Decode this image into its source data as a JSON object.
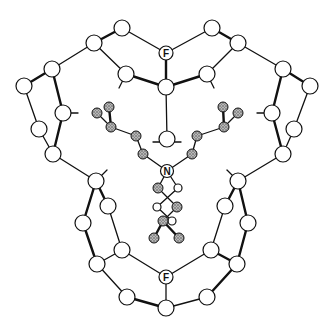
{
  "diagram": {
    "type": "molecular-structure",
    "labels": {
      "fluorine_top": "F",
      "fluorine_bottom": "F",
      "nitrogen": "N"
    },
    "colors": {
      "bond": "#111111",
      "atom_fill": "#ffffff",
      "shaded_atom": "#9a9a9a"
    },
    "cage_atoms": [
      {
        "id": "a1",
        "x": 122,
        "y": 28,
        "r": 8
      },
      {
        "id": "a2",
        "x": 94,
        "y": 43,
        "r": 8
      },
      {
        "id": "a3",
        "x": 52,
        "y": 69,
        "r": 8
      },
      {
        "id": "a4",
        "x": 24,
        "y": 86,
        "r": 8
      },
      {
        "id": "a5",
        "x": 126,
        "y": 74,
        "r": 8
      },
      {
        "id": "Ftop",
        "x": 166,
        "y": 53,
        "r": 6
      },
      {
        "id": "Ctop",
        "x": 166,
        "y": 87,
        "r": 8
      },
      {
        "id": "a6",
        "x": 212,
        "y": 28,
        "r": 8
      },
      {
        "id": "a7",
        "x": 238,
        "y": 43,
        "r": 8
      },
      {
        "id": "a8",
        "x": 283,
        "y": 69,
        "r": 8
      },
      {
        "id": "a9",
        "x": 310,
        "y": 86,
        "r": 8
      },
      {
        "id": "a10",
        "x": 207,
        "y": 74,
        "r": 8
      },
      {
        "id": "a11",
        "x": 63,
        "y": 113,
        "r": 8
      },
      {
        "id": "a12",
        "x": 39,
        "y": 129,
        "r": 8
      },
      {
        "id": "a13",
        "x": 53,
        "y": 154,
        "r": 8
      },
      {
        "id": "a14",
        "x": 272,
        "y": 113,
        "r": 8
      },
      {
        "id": "a15",
        "x": 294,
        "y": 129,
        "r": 8
      },
      {
        "id": "a16",
        "x": 283,
        "y": 154,
        "r": 8
      },
      {
        "id": "a17",
        "x": 167,
        "y": 139,
        "r": 8
      },
      {
        "id": "b1",
        "x": 96,
        "y": 181,
        "r": 8
      },
      {
        "id": "b2",
        "x": 108,
        "y": 206,
        "r": 8
      },
      {
        "id": "b3",
        "x": 83,
        "y": 223,
        "r": 8
      },
      {
        "id": "b4",
        "x": 122,
        "y": 250,
        "r": 8
      },
      {
        "id": "b5",
        "x": 97,
        "y": 264,
        "r": 8
      },
      {
        "id": "Fbot",
        "x": 166,
        "y": 277,
        "r": 6
      },
      {
        "id": "b6",
        "x": 127,
        "y": 297,
        "r": 8
      },
      {
        "id": "Cbot",
        "x": 166,
        "y": 308,
        "r": 8
      },
      {
        "id": "b7",
        "x": 238,
        "y": 181,
        "r": 8
      },
      {
        "id": "b8",
        "x": 225,
        "y": 206,
        "r": 8
      },
      {
        "id": "b9",
        "x": 248,
        "y": 223,
        "r": 8
      },
      {
        "id": "b10",
        "x": 211,
        "y": 250,
        "r": 8
      },
      {
        "id": "b11",
        "x": 237,
        "y": 264,
        "r": 8
      },
      {
        "id": "b12",
        "x": 207,
        "y": 297,
        "r": 8
      }
    ],
    "guest_atoms": [
      {
        "id": "N",
        "x": 167,
        "y": 171,
        "r": 6,
        "shaded": false
      },
      {
        "id": "g1",
        "x": 97,
        "y": 113,
        "r": 5,
        "shaded": true
      },
      {
        "id": "g2",
        "x": 109,
        "y": 107,
        "r": 5,
        "shaded": true
      },
      {
        "id": "g3",
        "x": 111,
        "y": 127,
        "r": 5,
        "shaded": true
      },
      {
        "id": "g4",
        "x": 136,
        "y": 136,
        "r": 5,
        "shaded": true
      },
      {
        "id": "g5",
        "x": 143,
        "y": 154,
        "r": 5,
        "shaded": true
      },
      {
        "id": "g6",
        "x": 223,
        "y": 107,
        "r": 5,
        "shaded": true
      },
      {
        "id": "g7",
        "x": 238,
        "y": 113,
        "r": 5,
        "shaded": true
      },
      {
        "id": "g8",
        "x": 224,
        "y": 127,
        "r": 5,
        "shaded": true
      },
      {
        "id": "g9",
        "x": 197,
        "y": 136,
        "r": 5,
        "shaded": true
      },
      {
        "id": "g10",
        "x": 192,
        "y": 154,
        "r": 5,
        "shaded": true
      },
      {
        "id": "g11",
        "x": 158,
        "y": 188,
        "r": 5,
        "shaded": true
      },
      {
        "id": "g12",
        "x": 178,
        "y": 188,
        "r": 4,
        "shaded": false
      },
      {
        "id": "g13",
        "x": 157,
        "y": 207,
        "r": 4,
        "shaded": false
      },
      {
        "id": "g14",
        "x": 177,
        "y": 207,
        "r": 5,
        "shaded": true
      },
      {
        "id": "g15",
        "x": 163,
        "y": 221,
        "r": 5,
        "shaded": true
      },
      {
        "id": "g16",
        "x": 172,
        "y": 221,
        "r": 4,
        "shaded": false
      },
      {
        "id": "g17",
        "x": 154,
        "y": 238,
        "r": 5,
        "shaded": true
      },
      {
        "id": "g18",
        "x": 179,
        "y": 238,
        "r": 5,
        "shaded": true
      }
    ]
  }
}
